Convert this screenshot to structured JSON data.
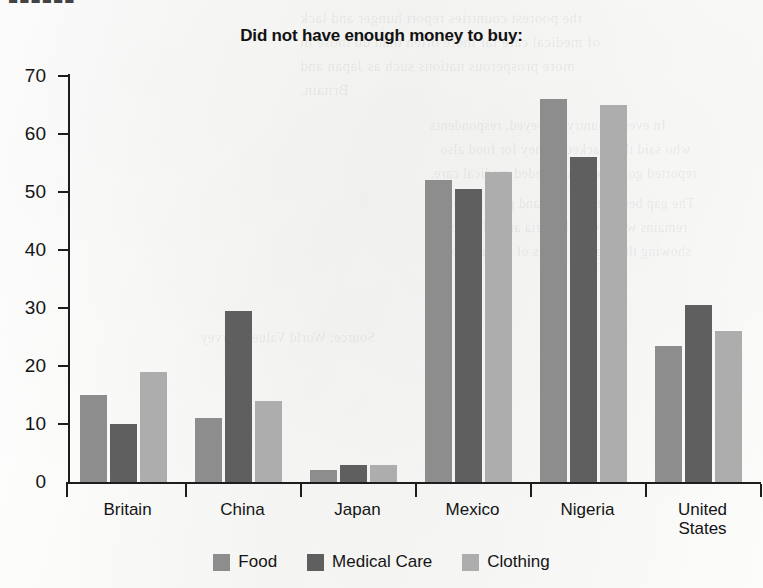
{
  "page": {
    "cropped_header_fragment": "■■■■■■",
    "ghost_text": [
      "the poorest countries report hunger and lack",
      "of medical care far more often than do those in",
      "more prosperous nations such as Japan and",
      "Britain.",
      "In every country surveyed, respondents",
      "who said they lacked money for food also",
      "reported going without needed medical care.",
      "The gap between the rich and poor nations",
      "remains wide, with Nigeria and Mexico",
      "showing the highest levels of deprivation.",
      "Source: World Values Survey"
    ]
  },
  "chart_data": {
    "type": "bar",
    "title": "Did not have enough money to buy:",
    "xlabel": "",
    "ylabel": "",
    "ylim": [
      0,
      70
    ],
    "ytick_step": 10,
    "yticks": [
      70,
      60,
      50,
      40,
      30,
      20,
      10,
      0
    ],
    "grid": false,
    "legend_position": "bottom",
    "categories": [
      "Britain",
      "China",
      "Japan",
      "Mexico",
      "Nigeria",
      "United States"
    ],
    "series": [
      {
        "name": "Food",
        "color": "#8d8d8d",
        "values": [
          15,
          11,
          2,
          52,
          66,
          23.5
        ]
      },
      {
        "name": "Medical Care",
        "color": "#5f5f5f",
        "values": [
          10,
          29.5,
          3,
          50.5,
          56,
          30.5
        ]
      },
      {
        "name": "Clothing",
        "color": "#adadad",
        "values": [
          19,
          14,
          3,
          53.5,
          65,
          26
        ]
      }
    ]
  }
}
